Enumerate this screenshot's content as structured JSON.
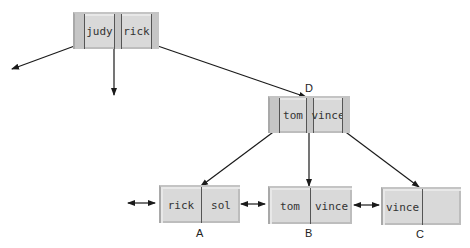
{
  "diagram": {
    "type": "b-plus-tree",
    "root": {
      "keys": [
        "judy",
        "rick"
      ]
    },
    "internal_D": {
      "label": "D",
      "keys": [
        "tom",
        "vince"
      ]
    },
    "leaves": [
      {
        "label": "A",
        "keys": [
          "rick",
          "sol"
        ]
      },
      {
        "label": "B",
        "keys": [
          "tom",
          "vince"
        ]
      },
      {
        "label": "C",
        "keys": [
          "vince",
          ""
        ]
      }
    ],
    "colors": {
      "node_fill": "#d9d9d9",
      "node_strip": "#c6c6c6",
      "edge": "#1a1a1a",
      "text": "#333333"
    }
  }
}
